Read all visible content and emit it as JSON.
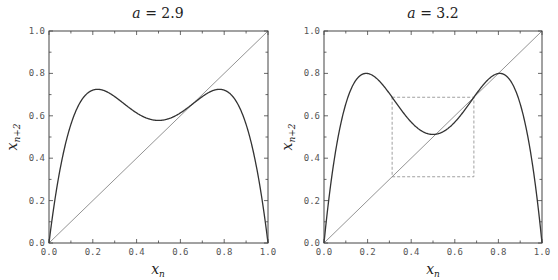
{
  "chart_data": [
    {
      "type": "line",
      "title": "a = 2.9",
      "title_var": "a",
      "title_value": "2.9",
      "parameter_a": 2.9,
      "xlabel": "x_n",
      "ylabel": "x_{n+2}",
      "xlim": [
        0.0,
        1.0
      ],
      "ylim": [
        0.0,
        1.0
      ],
      "xticks": [
        "0.0",
        "0.2",
        "0.4",
        "0.6",
        "0.8",
        "1.0"
      ],
      "yticks": [
        "0.0",
        "0.2",
        "0.4",
        "0.6",
        "0.8",
        "1.0"
      ],
      "grid": false,
      "legend": null,
      "series": [
        {
          "name": "second iterate f(f(x))",
          "style": "solid",
          "x": [
            0.0,
            0.1,
            0.2,
            0.3,
            0.4,
            0.5,
            0.6,
            0.7,
            0.8,
            0.9,
            1.0
          ],
          "y": [
            0.0,
            0.559,
            0.721,
            0.691,
            0.614,
            0.578,
            0.614,
            0.691,
            0.721,
            0.559,
            0.0
          ]
        },
        {
          "name": "diagonal y = x",
          "style": "thin",
          "x": [
            0.0,
            1.0
          ],
          "y": [
            0.0,
            1.0
          ]
        }
      ]
    },
    {
      "type": "line",
      "title": "a = 3.2",
      "title_var": "a",
      "title_value": "3.2",
      "parameter_a": 3.2,
      "xlabel": "x_n",
      "ylabel": "x_{n+2}",
      "xlim": [
        0.0,
        1.0
      ],
      "ylim": [
        0.0,
        1.0
      ],
      "xticks": [
        "0.0",
        "0.2",
        "0.4",
        "0.6",
        "0.8",
        "1.0"
      ],
      "yticks": [
        "0.0",
        "0.2",
        "0.4",
        "0.6",
        "0.8",
        "1.0"
      ],
      "grid": false,
      "legend": null,
      "series": [
        {
          "name": "second iterate f(f(x))",
          "style": "solid",
          "x": [
            0.0,
            0.1,
            0.2,
            0.3,
            0.4,
            0.5,
            0.6,
            0.7,
            0.8,
            0.9,
            1.0
          ],
          "y": [
            0.0,
            0.656,
            0.8,
            0.705,
            0.57,
            0.512,
            0.57,
            0.705,
            0.8,
            0.656,
            0.0
          ]
        },
        {
          "name": "diagonal y = x",
          "style": "thin",
          "x": [
            0.0,
            1.0
          ],
          "y": [
            0.0,
            1.0
          ]
        }
      ],
      "annotations": [
        {
          "type": "dashed-rectangle",
          "x0": 0.3125,
          "x1": 0.6875,
          "y0": 0.3125,
          "y1": 0.6875
        }
      ]
    }
  ],
  "colors": {
    "curve": "#333333",
    "diagonal": "#777777",
    "frame": "#444444",
    "dashed_box": "#888888"
  },
  "labels": {
    "panel1": {
      "title_var": "a",
      "title_rest": " = 2.9",
      "xlabel_main": "x",
      "xlabel_sub": "n",
      "ylabel_main": "x",
      "ylabel_sub": "n+2"
    },
    "panel2": {
      "title_var": "a",
      "title_rest": " = 3.2",
      "xlabel_main": "x",
      "xlabel_sub": "n",
      "ylabel_main": "x",
      "ylabel_sub": "n+2"
    }
  }
}
